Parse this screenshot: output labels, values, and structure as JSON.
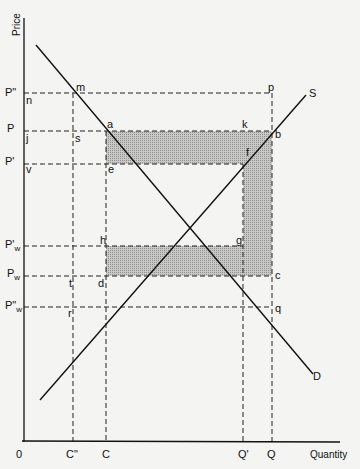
{
  "diagram": {
    "type": "supply-demand",
    "axes": {
      "y_title": "Price",
      "x_title": "Quantity",
      "origin_label": "0"
    },
    "price_levels": [
      {
        "id": "p2",
        "label": "P\"",
        "sub": ""
      },
      {
        "id": "p",
        "label": "P",
        "sub": ""
      },
      {
        "id": "p1",
        "label": "P'",
        "sub": ""
      },
      {
        "id": "pw1",
        "label": "P'",
        "sub": "w"
      },
      {
        "id": "pw",
        "label": "P",
        "sub": "w"
      },
      {
        "id": "pw2",
        "label": "P\"",
        "sub": "w"
      }
    ],
    "quantity_levels": [
      {
        "id": "c2",
        "label": "C\""
      },
      {
        "id": "c",
        "label": "C"
      },
      {
        "id": "q1",
        "label": "Q'"
      },
      {
        "id": "q",
        "label": "Q"
      }
    ],
    "curves": {
      "demand_label": "D",
      "supply_label": "S"
    },
    "points": {
      "n": "n",
      "m": "m",
      "p": "p",
      "j": "j",
      "s": "s",
      "a": "a",
      "k": "k",
      "b": "b",
      "v": "v",
      "e": "e",
      "f": "f",
      "h": "h",
      "g": "g",
      "t": "t",
      "d": "d",
      "c": "c",
      "r": "r",
      "q": "q"
    },
    "shaded_regions": [
      "akfe",
      "kbcg-strip",
      "hgcd"
    ],
    "colors": {
      "line": "#111111",
      "shade": "#b8b8b8",
      "background": "#f4f4f2"
    }
  }
}
